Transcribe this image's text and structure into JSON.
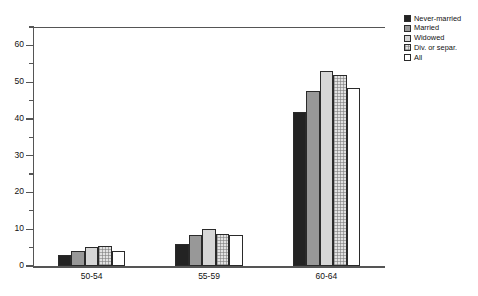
{
  "chart_data": {
    "type": "bar",
    "title": "",
    "xlabel": "",
    "ylabel": "",
    "categories": [
      "50-54",
      "55-59",
      "60-64"
    ],
    "ylim": [
      0,
      65
    ],
    "yticks": [
      0,
      10,
      20,
      30,
      40,
      50,
      60
    ],
    "ytick_labels": [
      "0",
      "10",
      "20",
      "30",
      "40",
      "50",
      "60"
    ],
    "yminor_ticks": [
      5,
      15,
      25,
      35,
      45,
      55,
      65
    ],
    "grid": false,
    "legend_position": "top-right",
    "series": [
      {
        "name": "Never-married",
        "fill": "solid-black",
        "color": "#232323",
        "values": [
          3.0,
          6.0,
          42.0
        ]
      },
      {
        "name": "Married",
        "fill": "solid-gray",
        "color": "#989898",
        "values": [
          4.0,
          8.5,
          47.5
        ]
      },
      {
        "name": "Widowed",
        "fill": "light-gray",
        "color": "#d6d6d6",
        "values": [
          5.3,
          10.0,
          53.0
        ]
      },
      {
        "name": "Div. or separ.",
        "fill": "dotted",
        "color": "#e2e2e2",
        "values": [
          5.5,
          8.8,
          52.0
        ]
      },
      {
        "name": "All",
        "fill": "white",
        "color": "#ffffff",
        "values": [
          4.2,
          8.5,
          48.5
        ]
      }
    ]
  },
  "legend": {
    "items": [
      {
        "label": "Never-married"
      },
      {
        "label": "Married"
      },
      {
        "label": "Widowed"
      },
      {
        "label": "Div. or separ."
      },
      {
        "label": "All"
      }
    ]
  }
}
